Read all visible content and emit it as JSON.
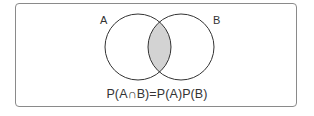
{
  "diagram": {
    "type": "venn",
    "sets": [
      {
        "label": "A"
      },
      {
        "label": "B"
      }
    ],
    "highlighted_region": "A∩B",
    "colors": {
      "stroke": "#333333",
      "intersection_fill": "#d3d3d3",
      "frame": "#8a8a8a"
    },
    "formula": "P(A∩B)=P(A)P(B)"
  }
}
